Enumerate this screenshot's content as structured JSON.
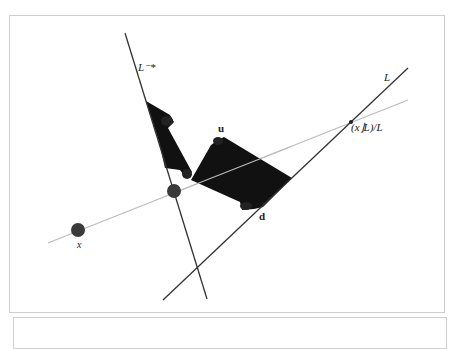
{
  "figure": {
    "labels": {
      "L_star": "L⁻*",
      "L": "L",
      "projection": "(x⌋L)/L",
      "u": "u",
      "d": "d",
      "x": "x"
    },
    "colors": {
      "background": "#ffffff",
      "panel_border": "#cfcfcf",
      "line_dark": "#333333",
      "line_light": "#bbbbbb",
      "shape_fill": "#111111",
      "point_fill": "#3a3a3a"
    },
    "lines": [
      {
        "name": "L_star",
        "x1": 125,
        "y1": 33,
        "x2": 207,
        "y2": 299
      },
      {
        "name": "L",
        "x1": 163,
        "y1": 300,
        "x2": 408,
        "y2": 68
      },
      {
        "name": "x_line",
        "x1": 48,
        "y1": 243,
        "x2": 408,
        "y2": 100
      }
    ],
    "points": [
      {
        "name": "x",
        "cx": 78,
        "cy": 230,
        "r": 7
      },
      {
        "name": "intersection",
        "cx": 174,
        "cy": 191,
        "r": 7
      },
      {
        "name": "projection",
        "cx": 351,
        "cy": 122,
        "r": 2
      }
    ]
  }
}
